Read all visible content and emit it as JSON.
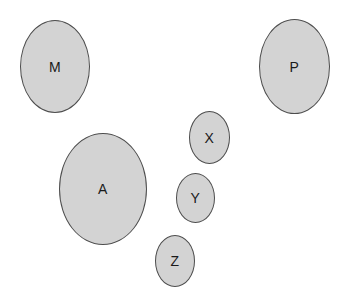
{
  "diagram": {
    "background": "#ffffff",
    "shape_fill": "#d3d3d3",
    "shape_stroke": "#4d4d4d",
    "label_color": "#1a1a1a"
  },
  "ellipses": [
    {
      "label": "M",
      "left": 20,
      "top": 20,
      "width": 70,
      "height": 93
    },
    {
      "label": "P",
      "left": 259,
      "top": 19,
      "width": 71,
      "height": 95
    },
    {
      "label": "X",
      "left": 189,
      "top": 111,
      "width": 41,
      "height": 53
    },
    {
      "label": "A",
      "left": 59,
      "top": 133,
      "width": 88,
      "height": 112
    },
    {
      "label": "Y",
      "left": 176,
      "top": 173,
      "width": 39,
      "height": 50
    },
    {
      "label": "Z",
      "left": 155,
      "top": 235,
      "width": 40,
      "height": 52
    }
  ]
}
